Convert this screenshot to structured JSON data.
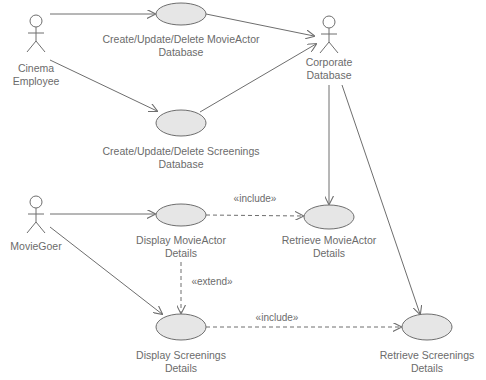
{
  "diagram": {
    "type": "UML use case diagram",
    "actors": [
      {
        "id": "cinema-employee",
        "line1": "Cinema",
        "line2": "Employee"
      },
      {
        "id": "corporate-database",
        "line1": "Corporate",
        "line2": "Database"
      },
      {
        "id": "moviegoer",
        "line1": "MovieGoer",
        "line2": ""
      }
    ],
    "use_cases": [
      {
        "id": "cud-movieactor",
        "line1": "Create/Update/Delete MovieActor",
        "line2": "Database"
      },
      {
        "id": "cud-screenings",
        "line1": "Create/Update/Delete Screenings",
        "line2": "Database"
      },
      {
        "id": "display-movieactor",
        "line1": "Display MovieActor",
        "line2": "Details"
      },
      {
        "id": "retrieve-movieactor",
        "line1": "Retrieve MovieActor",
        "line2": "Details"
      },
      {
        "id": "display-screenings",
        "line1": "Display Screenings",
        "line2": "Details"
      },
      {
        "id": "retrieve-screenings",
        "line1": "Retrieve Screenings",
        "line2": "Details"
      }
    ],
    "relationships": [
      {
        "from": "cinema-employee",
        "to": "cud-movieactor",
        "kind": "association"
      },
      {
        "from": "cinema-employee",
        "to": "cud-screenings",
        "kind": "association"
      },
      {
        "from": "cud-movieactor",
        "to": "corporate-database",
        "kind": "association"
      },
      {
        "from": "cud-screenings",
        "to": "corporate-database",
        "kind": "association"
      },
      {
        "from": "corporate-database",
        "to": "retrieve-movieactor",
        "kind": "association"
      },
      {
        "from": "corporate-database",
        "to": "retrieve-screenings",
        "kind": "association"
      },
      {
        "from": "moviegoer",
        "to": "display-movieactor",
        "kind": "association"
      },
      {
        "from": "moviegoer",
        "to": "display-screenings",
        "kind": "association"
      },
      {
        "from": "display-movieactor",
        "to": "retrieve-movieactor",
        "kind": "include",
        "label": "«include»"
      },
      {
        "from": "display-movieactor",
        "to": "display-screenings",
        "kind": "extend",
        "label": "«extend»"
      },
      {
        "from": "display-screenings",
        "to": "retrieve-screenings",
        "kind": "include",
        "label": "«include»"
      }
    ],
    "colors": {
      "line": "#6e6e6e",
      "ellipse_fill": "#e6e6e6",
      "text": "#6b6b6b"
    }
  }
}
